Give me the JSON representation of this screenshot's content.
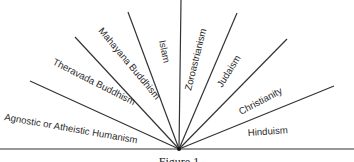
{
  "figure": {
    "caption": "Figure 1",
    "origin": {
      "x": 179,
      "y": 149
    },
    "baseline": {
      "x1": 0,
      "x2": 354,
      "y": 149
    },
    "stroke_color": "#333333",
    "text_color": "#2a2a2a",
    "rays": [
      {
        "x": 30,
        "y": 81
      },
      {
        "x": 75,
        "y": 37
      },
      {
        "x": 128,
        "y": 12
      },
      {
        "x": 181,
        "y": 0
      },
      {
        "x": 237,
        "y": 13
      },
      {
        "x": 287,
        "y": 39
      },
      {
        "x": 334,
        "y": 86
      }
    ],
    "sectors": [
      {
        "label": "Agnostic or Atheistic Humanism",
        "x": 4,
        "y": 120,
        "angle": 10
      },
      {
        "label": "Theravada Buddhism",
        "x": 52,
        "y": 64,
        "angle": 27
      },
      {
        "label": "Mahayana Buddhism",
        "x": 98,
        "y": 31,
        "angle": 50
      },
      {
        "label": "Islam",
        "x": 159,
        "y": 41,
        "angle": 78
      },
      {
        "label": "Zoroastrianism",
        "x": 191,
        "y": 91,
        "angle": -76
      },
      {
        "label": "Judaism",
        "x": 222,
        "y": 88,
        "angle": -58
      },
      {
        "label": "Christianity",
        "x": 241,
        "y": 115,
        "angle": -28
      },
      {
        "label": "Hinduism",
        "x": 248,
        "y": 136,
        "angle": -4
      }
    ]
  }
}
